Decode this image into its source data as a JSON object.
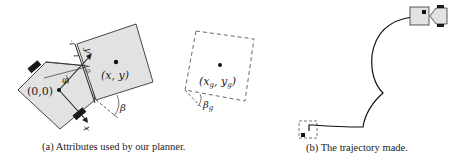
{
  "subfigures": [
    {
      "id": "a",
      "caption": "(a) Attributes used by our planner.",
      "labels": {
        "origin": "(0,0)",
        "position": "(x, y)",
        "goal": "(x_g, y_g)",
        "goal_x": "(x",
        "goal_sub_g1": "g",
        "goal_comma": ", y",
        "goal_sub_g2": "g",
        "goal_close": ")",
        "beta": "β",
        "beta_g": "β",
        "beta_g_sub": "g",
        "phi": "φ",
        "x_axis": "x",
        "y_axis": "y",
        "tick_neg1": "-1",
        "tick_0": "0",
        "tick_1": "1"
      }
    },
    {
      "id": "b",
      "caption": "(b) The trajectory made."
    }
  ],
  "colors": {
    "fill": "#e2e2e2",
    "stroke": "#333333",
    "wheel": "#1a1a1a",
    "text": "#222222"
  }
}
